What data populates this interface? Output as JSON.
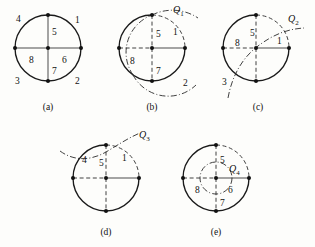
{
  "figure": {
    "background_color": "#fdfdfb",
    "ink_color": "#111111",
    "panels": [
      {
        "id": "a",
        "caption": "(a)",
        "caption_x": 48,
        "caption_y": 110,
        "center": {
          "x": 48,
          "y": 48
        },
        "radius": 33,
        "arcs": [
          {
            "name": "full-circle",
            "style": "solid",
            "from_deg": 0,
            "to_deg": 360
          }
        ],
        "diameters": [
          {
            "name": "vertical-diameter",
            "style": "solid-thin"
          },
          {
            "name": "horizontal-diameter",
            "style": "solid-thin"
          }
        ],
        "dots": [
          {
            "name": "dot-top",
            "x": 48,
            "y": 15
          },
          {
            "name": "dot-right",
            "x": 81,
            "y": 48
          },
          {
            "name": "dot-bottom",
            "x": 48,
            "y": 81
          },
          {
            "name": "dot-left",
            "x": 15,
            "y": 48
          },
          {
            "name": "dot-center",
            "x": 48,
            "y": 48
          }
        ],
        "labels": [
          {
            "name": "region-label-4",
            "text": "4",
            "x": 16,
            "y": 22
          },
          {
            "name": "region-label-1",
            "text": "1",
            "x": 75,
            "y": 23
          },
          {
            "name": "region-label-5",
            "text": "5",
            "x": 52,
            "y": 35
          },
          {
            "name": "region-label-8",
            "text": "8",
            "x": 29,
            "y": 63
          },
          {
            "name": "region-label-6",
            "text": "6",
            "x": 62,
            "y": 63
          },
          {
            "name": "region-label-7",
            "text": "7",
            "x": 52,
            "y": 73
          },
          {
            "name": "region-label-3",
            "text": "3",
            "x": 15,
            "y": 83
          },
          {
            "name": "region-label-2",
            "text": "2",
            "x": 75,
            "y": 83
          }
        ],
        "curve": null
      },
      {
        "id": "b",
        "caption": "(b)",
        "caption_x": 152,
        "caption_y": 110,
        "center": {
          "x": 152,
          "y": 48
        },
        "radius": 33,
        "arcs": [
          {
            "name": "arc-solid-left-lower",
            "style": "solid"
          },
          {
            "name": "arc-dashed-upper-right",
            "style": "dashed"
          }
        ],
        "dots": [
          {
            "name": "dot-top",
            "x": 152,
            "y": 15
          },
          {
            "name": "dot-right",
            "x": 185,
            "y": 48
          },
          {
            "name": "dot-bottom",
            "x": 152,
            "y": 81
          },
          {
            "name": "dot-left",
            "x": 119,
            "y": 48
          },
          {
            "name": "dot-center",
            "x": 152,
            "y": 48
          }
        ],
        "labels": [
          {
            "name": "region-label-5",
            "text": "5",
            "x": 156,
            "y": 37
          },
          {
            "name": "region-label-1",
            "text": "1",
            "x": 173,
            "y": 35
          },
          {
            "name": "region-label-8",
            "text": "8",
            "x": 130,
            "y": 63
          },
          {
            "name": "region-label-7",
            "text": "7",
            "x": 156,
            "y": 73
          },
          {
            "name": "region-label-2",
            "text": "2",
            "x": 183,
            "y": 85
          }
        ],
        "curve": {
          "name": "curve-Q1",
          "label": "Q",
          "subscript": "1",
          "label_x": 175,
          "label_y": 13,
          "style": "dashdot"
        }
      },
      {
        "id": "c",
        "caption": "(c)",
        "caption_x": 258,
        "caption_y": 110,
        "center": {
          "x": 256,
          "y": 48
        },
        "radius": 33,
        "arcs": [
          {
            "name": "arc-solid-major",
            "style": "solid"
          },
          {
            "name": "arc-dashed-upper-right",
            "style": "dashed"
          }
        ],
        "dots": [
          {
            "name": "dot-top",
            "x": 256,
            "y": 15
          },
          {
            "name": "dot-right",
            "x": 289,
            "y": 48
          },
          {
            "name": "dot-bottom",
            "x": 256,
            "y": 81
          },
          {
            "name": "dot-left",
            "x": 223,
            "y": 48
          },
          {
            "name": "dot-center",
            "x": 256,
            "y": 48
          }
        ],
        "labels": [
          {
            "name": "region-label-5",
            "text": "5",
            "x": 250,
            "y": 35
          },
          {
            "name": "region-label-8",
            "text": "8",
            "x": 236,
            "y": 45
          },
          {
            "name": "region-label-1",
            "text": "1",
            "x": 276,
            "y": 43
          },
          {
            "name": "region-label-3",
            "text": "3",
            "x": 223,
            "y": 84
          }
        ],
        "curve": {
          "name": "curve-Q2",
          "label": "Q",
          "subscript": "2",
          "label_x": 290,
          "label_y": 21,
          "style": "dashdot"
        }
      },
      {
        "id": "d",
        "caption": "(d)",
        "caption_x": 106,
        "caption_y": 235,
        "center": {
          "x": 106,
          "y": 178
        },
        "radius": 33,
        "arcs": [
          {
            "name": "arc-solid-major",
            "style": "solid"
          },
          {
            "name": "arc-dashed-upper-right",
            "style": "dashed"
          }
        ],
        "dots": [
          {
            "name": "dot-top",
            "x": 106,
            "y": 145
          },
          {
            "name": "dot-right",
            "x": 139,
            "y": 178
          },
          {
            "name": "dot-bottom",
            "x": 106,
            "y": 211
          },
          {
            "name": "dot-left",
            "x": 73,
            "y": 178
          },
          {
            "name": "dot-center",
            "x": 106,
            "y": 178
          }
        ],
        "labels": [
          {
            "name": "region-label-4",
            "text": "4",
            "x": 83,
            "y": 162
          },
          {
            "name": "region-label-5",
            "text": "5",
            "x": 99,
            "y": 164
          },
          {
            "name": "region-label-1",
            "text": "1",
            "x": 123,
            "y": 160
          }
        ],
        "curve": {
          "name": "curve-Q3",
          "label": "Q",
          "subscript": "3",
          "label_x": 140,
          "label_y": 137,
          "style": "dashdot"
        }
      },
      {
        "id": "e",
        "caption": "(e)",
        "caption_x": 216,
        "caption_y": 235,
        "center": {
          "x": 216,
          "y": 178
        },
        "radius": 33,
        "inner_radius": 16,
        "arcs": [
          {
            "name": "arc-solid-major",
            "style": "solid"
          },
          {
            "name": "arc-dashed-upper-right",
            "style": "dashed"
          }
        ],
        "dots": [
          {
            "name": "dot-top",
            "x": 216,
            "y": 145
          },
          {
            "name": "dot-right",
            "x": 249,
            "y": 178
          },
          {
            "name": "dot-bottom",
            "x": 216,
            "y": 211
          },
          {
            "name": "dot-left",
            "x": 183,
            "y": 178
          },
          {
            "name": "dot-center",
            "x": 216,
            "y": 178
          }
        ],
        "labels": [
          {
            "name": "region-label-5",
            "text": "5",
            "x": 220,
            "y": 161
          },
          {
            "name": "region-label-8",
            "text": "8",
            "x": 195,
            "y": 192
          },
          {
            "name": "region-label-6",
            "text": "6",
            "x": 228,
            "y": 192
          },
          {
            "name": "region-label-7",
            "text": "7",
            "x": 220,
            "y": 204
          }
        ],
        "curve": {
          "name": "curve-Q4",
          "label": "Q",
          "subscript": "4",
          "label_x": 230,
          "label_y": 170,
          "style": "dashdot"
        }
      }
    ]
  }
}
